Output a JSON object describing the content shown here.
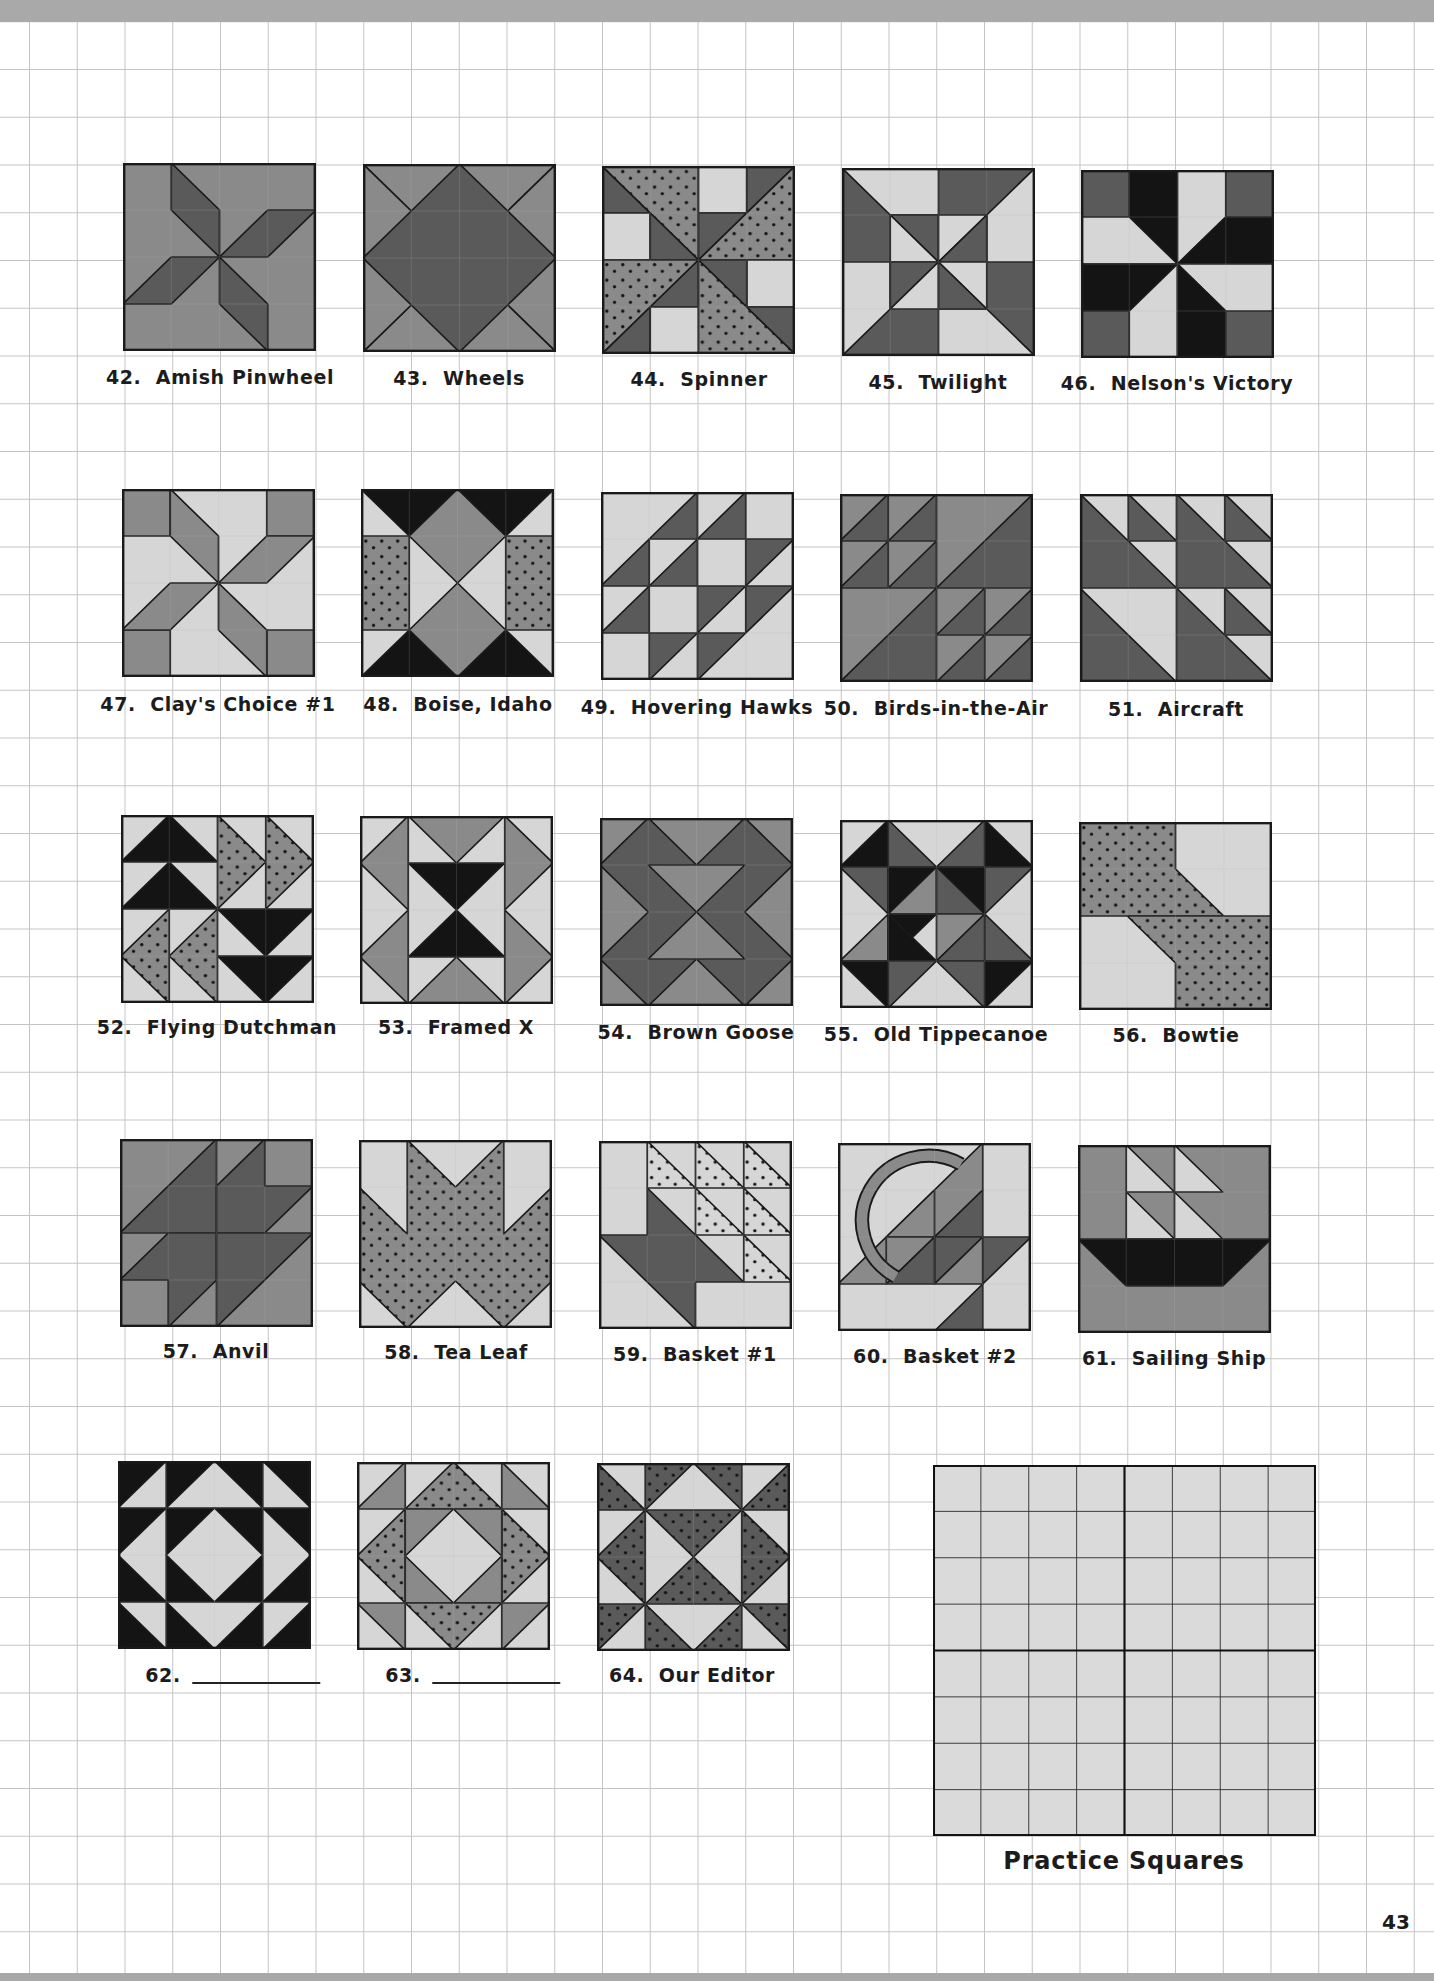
{
  "page": {
    "page_number": "43",
    "practice_label": "Practice Squares"
  },
  "colors": {
    "light": "#d6d6d6",
    "medium": "#8a8a8a",
    "dark": "#5a5a5a",
    "black": "#141414",
    "dotted": "#8a8a8a",
    "band": "#a9a9a9",
    "line": "#1a1a1a"
  },
  "blocks": [
    {
      "num": "42.",
      "name": "Amish Pinwheel",
      "x": 123,
      "y": 163,
      "lx": 220,
      "ly": 366
    },
    {
      "num": "43.",
      "name": "Wheels",
      "x": 363,
      "y": 164,
      "lx": 459,
      "ly": 367
    },
    {
      "num": "44.",
      "name": "Spinner",
      "x": 602,
      "y": 166,
      "lx": 699,
      "ly": 368
    },
    {
      "num": "45.",
      "name": "Twilight",
      "x": 842,
      "y": 168,
      "lx": 938,
      "ly": 371
    },
    {
      "num": "46.",
      "name": "Nelson's Victory",
      "x": 1081,
      "y": 170,
      "lx": 1177,
      "ly": 372
    },
    {
      "num": "47.",
      "name": "Clay's Choice #1",
      "x": 122,
      "y": 489,
      "lx": 218,
      "ly": 693
    },
    {
      "num": "48.",
      "name": "Boise, Idaho",
      "x": 361,
      "y": 489,
      "lx": 458,
      "ly": 693
    },
    {
      "num": "49.",
      "name": "Hovering Hawks",
      "x": 601,
      "y": 492,
      "lx": 697,
      "ly": 696
    },
    {
      "num": "50.",
      "name": "Birds-in-the-Air",
      "x": 840,
      "y": 494,
      "lx": 936,
      "ly": 697
    },
    {
      "num": "51.",
      "name": "Aircraft",
      "x": 1080,
      "y": 494,
      "lx": 1176,
      "ly": 698
    },
    {
      "num": "52.",
      "name": "Flying Dutchman",
      "x": 121,
      "y": 815,
      "lx": 217,
      "ly": 1016
    },
    {
      "num": "53.",
      "name": "Framed X",
      "x": 360,
      "y": 816,
      "lx": 456,
      "ly": 1016
    },
    {
      "num": "54.",
      "name": "Brown Goose",
      "x": 600,
      "y": 818,
      "lx": 696,
      "ly": 1021
    },
    {
      "num": "55.",
      "name": "Old Tippecanoe",
      "x": 840,
      "y": 820,
      "lx": 936,
      "ly": 1023
    },
    {
      "num": "56.",
      "name": "Bowtie",
      "x": 1079,
      "y": 822,
      "lx": 1176,
      "ly": 1024
    },
    {
      "num": "57.",
      "name": "Anvil",
      "x": 120,
      "y": 1139,
      "lx": 216,
      "ly": 1340
    },
    {
      "num": "58.",
      "name": "Tea Leaf",
      "x": 359,
      "y": 1140,
      "lx": 456,
      "ly": 1341
    },
    {
      "num": "59.",
      "name": "Basket #1",
      "x": 599,
      "y": 1141,
      "lx": 695,
      "ly": 1343
    },
    {
      "num": "60.",
      "name": "Basket #2",
      "x": 838,
      "y": 1143,
      "lx": 935,
      "ly": 1345
    },
    {
      "num": "61.",
      "name": "Sailing Ship",
      "x": 1078,
      "y": 1145,
      "lx": 1174,
      "ly": 1347
    },
    {
      "num": "62.",
      "name": "",
      "x": 118,
      "y": 1461,
      "lx": 233,
      "ly": 1664,
      "blank": true
    },
    {
      "num": "63.",
      "name": "",
      "x": 357,
      "y": 1462,
      "lx": 473,
      "ly": 1664,
      "blank": true
    },
    {
      "num": "64.",
      "name": "Our Editor",
      "x": 597,
      "y": 1463,
      "lx": 692,
      "ly": 1664
    }
  ]
}
